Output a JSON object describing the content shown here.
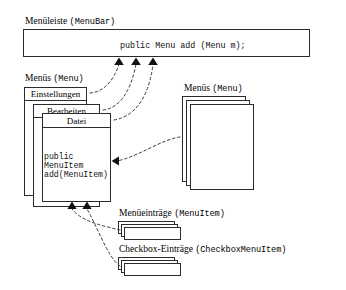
{
  "figure": {
    "language": "de",
    "title_text": "",
    "background": "#ffffff",
    "line_color": "#2b2b2b"
  },
  "menubar": {
    "label_de": "Menüleiste",
    "label_code": "(MenuBar)",
    "code_line": "public Menu add (Menu m);"
  },
  "menus_left": {
    "label_de": "Menüs",
    "label_code": "(Menu)",
    "stack": [
      {
        "title": "Einstellungen"
      },
      {
        "title": "Bearbeiten"
      },
      {
        "title": "Datei"
      }
    ],
    "code_line_1": "public",
    "code_line_2": "MenuItem",
    "code_line_3": "add(MenuItem)"
  },
  "menus_right": {
    "label_de": "Menüs",
    "label_code": "(Menu)",
    "stack_count": 3
  },
  "menuitems": {
    "label_de": "Menüeinträge",
    "label_code": "(MenuItem)",
    "stack_count": 3
  },
  "checkbox_menuitems": {
    "label_de": "Checkbox-Einträge",
    "label_code": "(CheckboxMenuItem)",
    "stack_count": 3
  },
  "arrows": {
    "to_menubar_count": 3,
    "into_datei_right_count": 1,
    "into_datei_bottom_count": 2,
    "style": "dashed-curve-with-solid-arrowhead"
  }
}
